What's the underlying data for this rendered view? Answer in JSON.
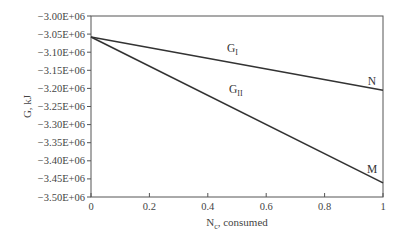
{
  "chart_data": {
    "type": "line",
    "title": "",
    "xlabel": "N",
    "xlabel_subscript": "c",
    "xlabel_suffix": ", consumed",
    "ylabel": "G, kJ",
    "xlim": [
      0,
      1
    ],
    "ylim": [
      -3500000.0,
      -3000000.0
    ],
    "grid": false,
    "legend": "none",
    "x_ticks": [
      0,
      0.2,
      0.4,
      0.6,
      0.8,
      1
    ],
    "x_tick_labels": [
      "0",
      "0.2",
      "0.4",
      "0.6",
      "0.8",
      "1"
    ],
    "y_ticks": [
      -3000000.0,
      -3050000.0,
      -3100000.0,
      -3150000.0,
      -3200000.0,
      -3250000.0,
      -3300000.0,
      -3350000.0,
      -3400000.0,
      -3450000.0,
      -3500000.0
    ],
    "y_tick_labels": [
      "−3.00E+06",
      "−3.05E+06",
      "−3.10E+06",
      "−3.15E+06",
      "−3.20E+06",
      "−3.25E+06",
      "−3.30E+06",
      "−3.35E+06",
      "−3.40E+06",
      "−3.45E+06",
      "−3.50E+06"
    ],
    "series": [
      {
        "name": "G_I",
        "label_main": "G",
        "label_sub": "I",
        "end_label": "N",
        "x": [
          0,
          1
        ],
        "values": [
          -3058000.0,
          -3205000.0
        ],
        "color": "#333333"
      },
      {
        "name": "G_II",
        "label_main": "G",
        "label_sub": "II",
        "end_label": "M",
        "x": [
          0,
          1
        ],
        "values": [
          -3058000.0,
          -3461000.0
        ],
        "color": "#333333"
      }
    ],
    "annotations": [
      {
        "text": "G_I",
        "x": 0.5,
        "y": -3100000.0
      },
      {
        "text": "G_II",
        "x": 0.5,
        "y": -3170000.0
      },
      {
        "text": "N",
        "x": 0.97,
        "y": -3190000.0
      },
      {
        "text": "M",
        "x": 0.97,
        "y": -3420000.0
      }
    ]
  }
}
